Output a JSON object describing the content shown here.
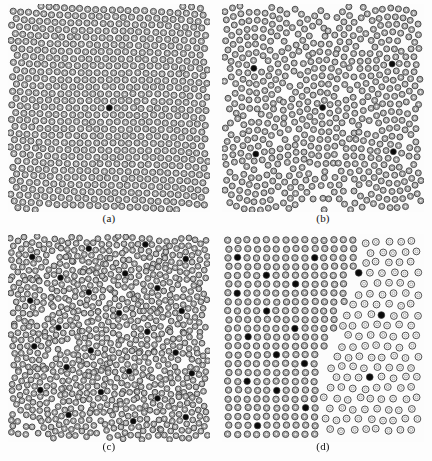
{
  "figure": {
    "width": 432,
    "height": 461,
    "background_color": "#fdfdfd",
    "panel_count": 4,
    "layout": "2x2 grid"
  },
  "style": {
    "particle_outline_color": "#3a3a3a",
    "particle_gray_fill": "#b4b4b4",
    "particle_white_fill": "#ffffff",
    "particle_dark_fill": "#0a0a0a",
    "panel_background": "#fcfcfc"
  },
  "panels": [
    {
      "id": "a",
      "label": "(a)",
      "x": 8,
      "y": 4,
      "width": 202,
      "height": 208,
      "pattern": "single-crystal",
      "description": "Regular curved hexagonal lattice of gray ringed particles with one dark defect particle at the center",
      "dark_particle_count": 1,
      "particle_radius": 3.1,
      "lattice_spacing": 8.1,
      "particle_fill": "#b9b9b9",
      "dark_particles": [
        [
          0.5,
          0.5
        ]
      ]
    },
    {
      "id": "b",
      "label": "(b)",
      "x": 222,
      "y": 4,
      "width": 202,
      "height": 208,
      "pattern": "large-grain-polycrystal",
      "description": "Several large curved grains radiating from dark disclination cores, separated by grain boundaries",
      "dark_particle_count": 5,
      "particle_radius": 3.0,
      "lattice_spacing": 8.0,
      "particle_fill": "#b9b9b9",
      "dark_particles": [
        [
          0.5,
          0.5
        ],
        [
          0.16,
          0.31
        ],
        [
          0.84,
          0.29
        ],
        [
          0.17,
          0.72
        ],
        [
          0.85,
          0.71
        ]
      ]
    },
    {
      "id": "c",
      "label": "(c)",
      "x": 8,
      "y": 234,
      "width": 202,
      "height": 208,
      "pattern": "fine-grain-polycrystal",
      "description": "Many small cellular grains, each nucleated on a dark core particle, giving a dense disordered texture",
      "dark_particle_count": 25,
      "particle_radius": 2.9,
      "lattice_spacing": 7.4,
      "particle_fill": "#b9b9b9",
      "dark_particles": [
        [
          0.12,
          0.11
        ],
        [
          0.4,
          0.07
        ],
        [
          0.68,
          0.05
        ],
        [
          0.88,
          0.12
        ],
        [
          0.26,
          0.21
        ],
        [
          0.58,
          0.19
        ],
        [
          0.4,
          0.28
        ],
        [
          0.74,
          0.26
        ],
        [
          0.11,
          0.32
        ],
        [
          0.55,
          0.38
        ],
        [
          0.86,
          0.37
        ],
        [
          0.25,
          0.45
        ],
        [
          0.69,
          0.47
        ],
        [
          0.13,
          0.54
        ],
        [
          0.41,
          0.56
        ],
        [
          0.83,
          0.57
        ],
        [
          0.29,
          0.64
        ],
        [
          0.6,
          0.66
        ],
        [
          0.91,
          0.67
        ],
        [
          0.16,
          0.75
        ],
        [
          0.46,
          0.76
        ],
        [
          0.74,
          0.79
        ],
        [
          0.3,
          0.87
        ],
        [
          0.62,
          0.9
        ],
        [
          0.88,
          0.88
        ]
      ]
    },
    {
      "id": "d",
      "label": "(d)",
      "x": 222,
      "y": 234,
      "width": 202,
      "height": 208,
      "pattern": "two-phase-coexistence",
      "description": "Two coexisting phases: a dense gray square-packed region on the left and a dilute hollow-circle region on the right, separated by a diagonal interface",
      "dark_particle_count": 20,
      "particle_radius": 3.2,
      "lattice_spacing": 9.6,
      "particle_fill": "#b9b9b9",
      "phase_left": {
        "name": "dense",
        "fill": "#b9b9b9",
        "spacing": 9.6
      },
      "phase_right": {
        "name": "dilute",
        "fill": "#ffffff",
        "spacing": 11.6
      },
      "dark_particles": [
        [
          0.33,
          0.05
        ],
        [
          0.06,
          0.11
        ],
        [
          0.45,
          0.13
        ],
        [
          0.2,
          0.19
        ],
        [
          0.36,
          0.24
        ],
        [
          0.09,
          0.29
        ],
        [
          0.24,
          0.36
        ],
        [
          0.38,
          0.45
        ],
        [
          0.12,
          0.49
        ],
        [
          0.26,
          0.57
        ],
        [
          0.42,
          0.62
        ],
        [
          0.14,
          0.69
        ],
        [
          0.29,
          0.75
        ],
        [
          0.4,
          0.83
        ],
        [
          0.16,
          0.91
        ],
        [
          0.68,
          0.2
        ],
        [
          0.78,
          0.39
        ],
        [
          0.62,
          0.53
        ],
        [
          0.72,
          0.68
        ],
        [
          0.86,
          0.82
        ]
      ]
    }
  ]
}
